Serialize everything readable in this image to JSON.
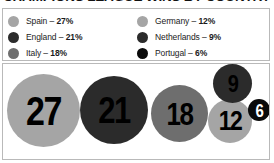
{
  "title": "CHAMPIONS LEAGUE WINS BY COUNTRY",
  "legend": {
    "columns": [
      {
        "name": "left-column",
        "items": [
          {
            "country": "Spain",
            "separator": " – ",
            "percent": "27%",
            "swatch_color": "#a5a5a5",
            "swatch_name": "legend-swatch-spain"
          },
          {
            "country": "England",
            "separator": " – ",
            "percent": "21%",
            "swatch_color": "#2b2b2b",
            "swatch_name": "legend-swatch-england"
          },
          {
            "country": "Italy",
            "separator": " – ",
            "percent": "18%",
            "swatch_color": "#6e6e6e",
            "swatch_name": "legend-swatch-italy"
          }
        ]
      },
      {
        "name": "right-column",
        "items": [
          {
            "country": "Germany",
            "separator": " – ",
            "percent": "12%",
            "swatch_color": "#a5a5a5",
            "swatch_name": "legend-swatch-germany"
          },
          {
            "country": "Netherlands",
            "separator": " – ",
            "percent": "9%",
            "swatch_color": "#2b2b2b",
            "swatch_name": "legend-swatch-netherlands"
          },
          {
            "country": "Portugal",
            "separator": " – ",
            "percent": "6%",
            "swatch_color": "#0a0a0a",
            "swatch_name": "legend-swatch-portugal"
          }
        ]
      }
    ]
  },
  "chart_data": {
    "type": "bar",
    "title": "CHAMPIONS LEAGUE WINS BY COUNTRY",
    "subtype": "proportional-bubble",
    "xlabel": "",
    "ylabel": "",
    "categories": [
      "Spain",
      "England",
      "Italy",
      "Germany",
      "Netherlands",
      "Portugal"
    ],
    "values": [
      27,
      21,
      18,
      12,
      9,
      6
    ],
    "value_labels": [
      "27",
      "21",
      "18",
      "12",
      "9",
      "6"
    ],
    "percent_labels": [
      "27%",
      "21%",
      "18%",
      "12%",
      "9%",
      "6%"
    ],
    "unit": "percent of wins",
    "grid": false,
    "legend_position": "top",
    "bubbles": [
      {
        "label": "27",
        "country": "Spain",
        "value": 27,
        "color": "#a5a5a5",
        "text_color": "#000000",
        "x": 4,
        "y": 10,
        "d": 73,
        "font": 34
      },
      {
        "label": "21",
        "country": "England",
        "value": 21,
        "color": "#2b2b2b",
        "text_color": "#000000",
        "x": 77,
        "y": 12,
        "d": 68,
        "font": 31
      },
      {
        "label": "18",
        "country": "Italy",
        "value": 18,
        "color": "#6e6e6e",
        "text_color": "#000000",
        "x": 148,
        "y": 21,
        "d": 57,
        "font": 26
      },
      {
        "label": "12",
        "country": "Germany",
        "value": 12,
        "color": "#a5a5a5",
        "text_color": "#000000",
        "x": 205,
        "y": 35,
        "d": 44,
        "font": 23
      },
      {
        "label": "9",
        "country": "Netherlands",
        "value": 9,
        "color": "#2b2b2b",
        "text_color": "#000000",
        "x": 210,
        "y": 0,
        "d": 39,
        "font": 20
      },
      {
        "label": "6",
        "country": "Portugal",
        "value": 6,
        "color": "#0a0a0a",
        "text_color": "#ffffff",
        "x": 245,
        "y": 35,
        "d": 22,
        "font": 15
      }
    ]
  }
}
